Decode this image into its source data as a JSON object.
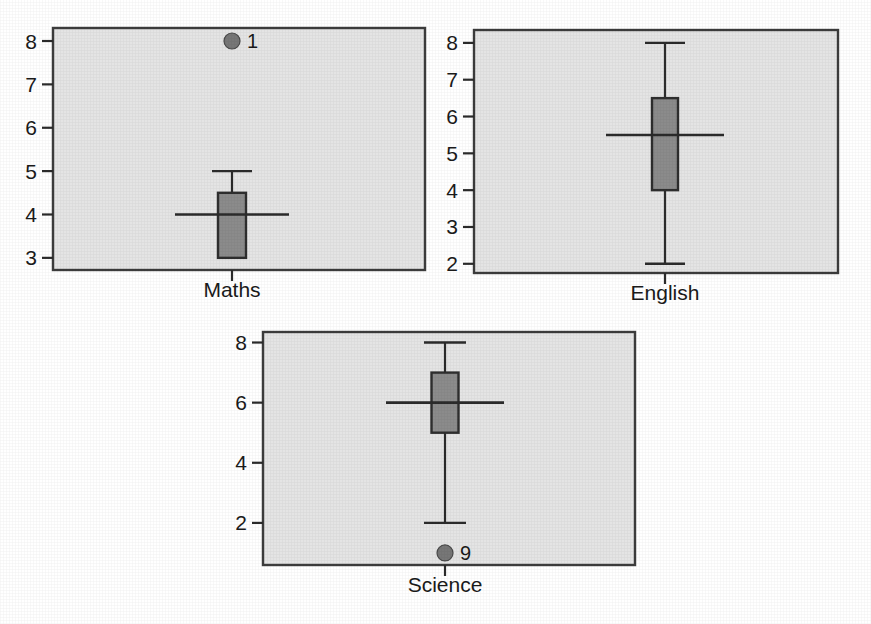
{
  "chart_data": {
    "type": "box",
    "title": "",
    "subtitle": "",
    "xlabel": "",
    "ylabel": "",
    "grid": false,
    "legend": "none",
    "layout": "three panels: two side by side on top row, one centered on bottom row",
    "panels": [
      {
        "name": "maths",
        "category": "Maths",
        "axis_title": "Maths",
        "ylim": [
          2.72,
          8.3
        ],
        "yticks": [
          3,
          4,
          5,
          6,
          7,
          8
        ],
        "ytick_labels": [
          "3",
          "4",
          "5",
          "6",
          "7",
          "8"
        ],
        "box": {
          "q1": 3,
          "median": 4,
          "q3": 4.5,
          "whisker_low": 3,
          "whisker_high": 5
        },
        "outliers": [
          {
            "value": 8,
            "label": "1"
          }
        ]
      },
      {
        "name": "english",
        "category": "English",
        "axis_title": "English",
        "ylim": [
          1.75,
          8.35
        ],
        "yticks": [
          2,
          3,
          4,
          5,
          6,
          7,
          8
        ],
        "ytick_labels": [
          "2",
          "3",
          "4",
          "5",
          "6",
          "7",
          "8"
        ],
        "box": {
          "q1": 4,
          "median": 5.5,
          "q3": 6.5,
          "whisker_low": 2,
          "whisker_high": 8
        },
        "outliers": []
      },
      {
        "name": "science",
        "category": "Science",
        "axis_title": "Science",
        "ylim": [
          0.6,
          8.35
        ],
        "yticks": [
          2,
          4,
          6,
          8
        ],
        "ytick_labels": [
          "2",
          "4",
          "6",
          "8"
        ],
        "box": {
          "q1": 5,
          "median": 6,
          "q3": 7,
          "whisker_low": 2,
          "whisker_high": 8
        },
        "outliers": [
          {
            "value": 1,
            "label": "9"
          }
        ]
      }
    ],
    "colors": {
      "panel_background": "#e4e4e4",
      "panel_frame": "#3c3c3c",
      "box_fill": "#8b8b8b",
      "box_stroke": "#2e2e2e",
      "whisker": "#2b2b2b",
      "outlier_fill": "#777777",
      "text": "#1a1a1a",
      "page_background": "#ffffff"
    }
  },
  "geometry": {
    "panels": [
      {
        "name": "maths",
        "x": 53,
        "y": 28,
        "w": 372,
        "h": 242,
        "cx": 232,
        "box_w": 28,
        "median_w": 114,
        "cap_w": 40,
        "title_y": 297
      },
      {
        "name": "english",
        "x": 474,
        "y": 30,
        "w": 364,
        "h": 243,
        "cx": 665,
        "box_w": 26,
        "median_w": 118,
        "cap_w": 40,
        "title_y": 300
      },
      {
        "name": "science",
        "x": 263,
        "y": 332,
        "w": 372,
        "h": 233,
        "cx": 445,
        "box_w": 27,
        "median_w": 118,
        "cap_w": 42,
        "title_y": 592
      }
    ],
    "outlier_radius": 8
  }
}
